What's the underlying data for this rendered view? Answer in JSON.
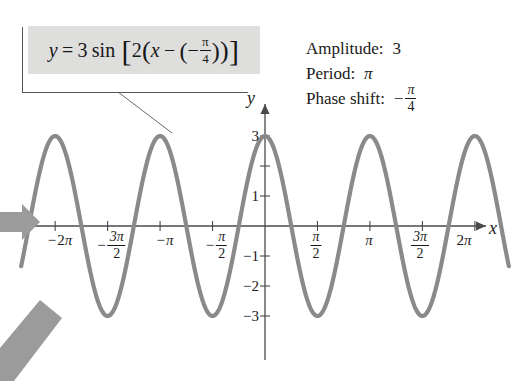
{
  "figure": {
    "background": "#ffffff",
    "curve_color": "#8a8a8a",
    "axis_color": "#4a4a4a",
    "callout_bg": "#dededd",
    "arrow_color": "#9b9b9b"
  },
  "equation": {
    "lhs": "y",
    "equals": "=",
    "amplitude_coefficient": "3",
    "function": "sin",
    "open_bracket": "[",
    "b_coefficient": "2",
    "open_paren": "(",
    "variable": "x",
    "minus": "−",
    "inner_open_paren": "(",
    "inner_sign": "−",
    "frac_num": "π",
    "frac_den": "4",
    "inner_close_paren": ")",
    "close_paren": ")",
    "close_bracket": "]",
    "full_text": "y = 3 sin [2(x − (−π/4))]"
  },
  "annotations": [
    {
      "label": "Amplitude:",
      "value": "3",
      "value_type": "number"
    },
    {
      "label": "Period:",
      "value": "π",
      "value_type": "symbol"
    },
    {
      "label": "Phase shift:",
      "value": "−π/4",
      "value_type": "fraction",
      "sign": "−",
      "num": "π",
      "den": "4"
    }
  ],
  "axes": {
    "x_axis_label": "x",
    "y_axis_label": "y",
    "x_ticks": [
      {
        "label": "−2π",
        "value": -6.283185,
        "sign": "−",
        "coef": "2",
        "sym": "π",
        "kind": "plain"
      },
      {
        "label": "−3π/2",
        "value": -4.712389,
        "sign": "−",
        "num": "3π",
        "den": "2",
        "kind": "fraction"
      },
      {
        "label": "−π",
        "value": -3.141593,
        "sign": "−",
        "coef": "",
        "sym": "π",
        "kind": "plain"
      },
      {
        "label": "−π/2",
        "value": -1.570796,
        "sign": "−",
        "num": "π",
        "den": "2",
        "kind": "fraction"
      },
      {
        "label": "π/2",
        "value": 1.570796,
        "sign": "",
        "num": "π",
        "den": "2",
        "kind": "fraction"
      },
      {
        "label": "π",
        "value": 3.141593,
        "sign": "",
        "coef": "",
        "sym": "π",
        "kind": "plain"
      },
      {
        "label": "3π/2",
        "value": 4.712389,
        "sign": "",
        "num": "3π",
        "den": "2",
        "kind": "fraction"
      },
      {
        "label": "2π",
        "value": 6.283185,
        "sign": "",
        "coef": "2",
        "sym": "π",
        "kind": "plain"
      }
    ],
    "y_ticks": [
      {
        "label": "3",
        "value": 3
      },
      {
        "label": "1",
        "value": 1
      },
      {
        "label": "−1",
        "value": -1
      },
      {
        "label": "−2",
        "value": -2
      },
      {
        "label": "−3",
        "value": -3
      }
    ],
    "x_range": [
      -7.3,
      7.3
    ],
    "y_range": [
      -3.6,
      3.6
    ]
  },
  "chart_data": {
    "type": "line",
    "title": "",
    "xlabel": "x",
    "ylabel": "y",
    "function_expression": "y = 3 sin[2(x + pi/4)]",
    "amplitude": 3,
    "period": 3.141593,
    "phase_shift": -0.785398,
    "vertical_shift": 0,
    "b": 2,
    "xlim": [
      -7.3,
      7.3
    ],
    "ylim": [
      -3.6,
      3.6
    ],
    "grid": false,
    "legend": "none",
    "xticks": [
      -6.283185,
      -4.712389,
      -3.141593,
      -1.570796,
      1.570796,
      3.141593,
      4.712389,
      6.283185
    ],
    "xticklabels": [
      "−2π",
      "−3π/2",
      "−π",
      "−π/2",
      "π/2",
      "π",
      "3π/2",
      "2π"
    ],
    "yticks": [
      3,
      1,
      -1,
      -2,
      -3
    ],
    "yticklabels": [
      "3",
      "1",
      "−1",
      "−2",
      "−3"
    ],
    "maxima_x": [
      -5.497787,
      -2.356194,
      0.785398,
      3.926991
    ],
    "minima_x": [
      -3.926991,
      -0.785398,
      2.356194,
      5.497787
    ],
    "zeros_x": [
      -6.283185,
      -4.712389,
      -3.141593,
      -1.570796,
      0.0,
      1.570796,
      3.141593,
      4.712389,
      6.283185
    ],
    "value_at_zero": 2.12132,
    "series": [
      {
        "name": "y = 3 sin[2(x + π/4)]",
        "color": "#8a8a8a",
        "x": [
          -7.3,
          -7.0,
          -6.6,
          -6.283185,
          -5.9,
          -5.497787,
          -5.1,
          -4.712389,
          -4.3,
          -3.926991,
          -3.5,
          -3.141593,
          -2.8,
          -2.356194,
          -1.95,
          -1.570796,
          -1.2,
          -0.785398,
          -0.4,
          0.0,
          0.4,
          0.785398,
          1.2,
          1.570796,
          1.95,
          2.356194,
          2.8,
          3.141593,
          3.5,
          3.926991,
          4.3,
          4.712389,
          5.1,
          5.497787,
          5.9,
          6.283185,
          6.6,
          7.0,
          7.3
        ],
        "y": [
          -1.63,
          -2.62,
          -1.17,
          0.0,
          2.06,
          3.0,
          2.29,
          0.0,
          -2.33,
          -3.0,
          -1.98,
          0.0,
          1.83,
          3.0,
          2.39,
          0.0,
          -2.14,
          -3.0,
          -2.19,
          2.12,
          2.27,
          3.0,
          2.04,
          0.0,
          -2.39,
          -3.0,
          -1.69,
          0.0,
          2.04,
          3.0,
          2.24,
          0.0,
          -2.27,
          -3.0,
          -2.12,
          0.0,
          1.36,
          2.72,
          1.63
        ]
      }
    ]
  },
  "pointers": [
    {
      "name": "horizontal-pointer",
      "direction": "right"
    },
    {
      "name": "diagonal-pointer",
      "direction": "up-right"
    }
  ]
}
